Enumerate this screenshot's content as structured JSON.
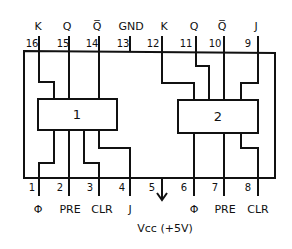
{
  "diagram": {
    "top_signals": [
      "K",
      "Q",
      "Q̅",
      "GND",
      "K",
      "Q",
      "Q̅",
      "J"
    ],
    "top_pins": [
      "16",
      "15",
      "14",
      "13",
      "12",
      "11",
      "10",
      "9"
    ],
    "bottom_pins": [
      "1",
      "2",
      "3",
      "4",
      "5",
      "6",
      "7",
      "8"
    ],
    "bottom_signals": [
      "Φ",
      "PRE",
      "CLR",
      "J",
      "",
      "Φ",
      "PRE",
      "CLR"
    ],
    "flipflops": [
      {
        "label": "1"
      },
      {
        "label": "2"
      }
    ],
    "vcc_label": "Vcc (+5V)",
    "colors": {
      "ink": "#111111",
      "background": "#ffffff"
    }
  }
}
